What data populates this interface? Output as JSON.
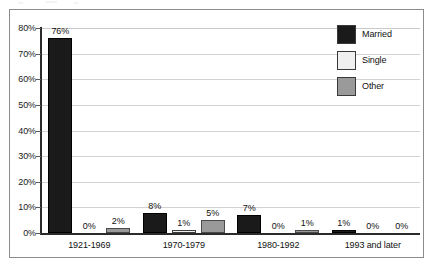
{
  "figure": {
    "frame_border_color": "#8c8c8c",
    "background_color": "#ffffff"
  },
  "legend": {
    "position": "top-right",
    "entries": [
      {
        "label": "Married",
        "color": "#1a1a1a",
        "swatch_name": "legend-swatch-married"
      },
      {
        "label": "Single",
        "color": "#f0f0f0",
        "swatch_name": "legend-swatch-single"
      },
      {
        "label": "Other",
        "color": "#9a9a9a",
        "swatch_name": "legend-swatch-other"
      }
    ]
  },
  "axes": {
    "y_tick_labels": [
      "80%",
      "70%",
      "60%",
      "50%",
      "40%",
      "30%",
      "20%",
      "10%",
      "0%"
    ],
    "x_tick_labels": [
      "1921-1969",
      "1970-1979",
      "1980-1992",
      "1993 and later"
    ]
  },
  "bar_labels": {
    "g0": [
      "76%",
      "0%",
      "2%"
    ],
    "g1": [
      "8%",
      "1%",
      "5%"
    ],
    "g2": [
      "7%",
      "0%",
      "1%"
    ],
    "g3": [
      "1%",
      "0%",
      "0%"
    ]
  },
  "chart_data": {
    "type": "bar",
    "title": "",
    "subtitle": "",
    "xlabel": "",
    "ylabel": "",
    "categories": [
      "1921-1969",
      "1970-1979",
      "1980-1992",
      "1993 and later"
    ],
    "series": [
      {
        "name": "Married",
        "values": [
          76,
          0,
          2,
          0
        ],
        "color": "#1a1a1a"
      },
      {
        "name": "Single",
        "values": [
          0,
          1,
          0,
          0
        ],
        "color": "#f0f0f0"
      },
      {
        "name": "Other",
        "values": [
          2,
          5,
          1,
          0
        ],
        "color": "#9a9a9a"
      }
    ],
    "series_values_by_category": {
      "1921-1969": {
        "Married": 76,
        "Single": 0,
        "Other": 2
      },
      "1970-1979": {
        "Married": 8,
        "Single": 1,
        "Other": 5
      },
      "1980-1992": {
        "Married": 7,
        "Single": 0,
        "Other": 1
      },
      "1993 and later": {
        "Married": 1,
        "Single": 0,
        "Other": 0
      }
    },
    "data_labels": [
      "76%",
      "0%",
      "2%",
      "8%",
      "1%",
      "5%",
      "7%",
      "0%",
      "1%",
      "1%",
      "0%",
      "0%"
    ],
    "ylim": [
      0,
      80
    ],
    "ytick_step": 10,
    "ytick_values": [
      0,
      10,
      20,
      30,
      40,
      50,
      60,
      70,
      80
    ],
    "ytick_labels": [
      "0%",
      "10%",
      "20%",
      "30%",
      "40%",
      "50%",
      "60%",
      "70%",
      "80%"
    ],
    "grid": "horizontal",
    "legend_position": "top-right",
    "units": "percent"
  }
}
